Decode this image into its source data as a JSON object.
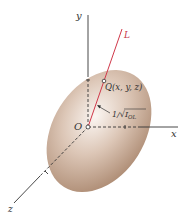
{
  "diagram": {
    "type": "ellipsoid-of-inertia",
    "labels": {
      "y_axis": "y",
      "x_axis": "x",
      "z_axis": "z",
      "origin": "O",
      "line": "L",
      "point": "Q(x, y, z)",
      "distance": "1/√I",
      "distance_sub": "OL"
    },
    "colors": {
      "axis": "#333333",
      "line_L": "#d0384a",
      "ellipsoid_light": "#f6eee8",
      "ellipsoid_dark": "#a8856c"
    }
  }
}
